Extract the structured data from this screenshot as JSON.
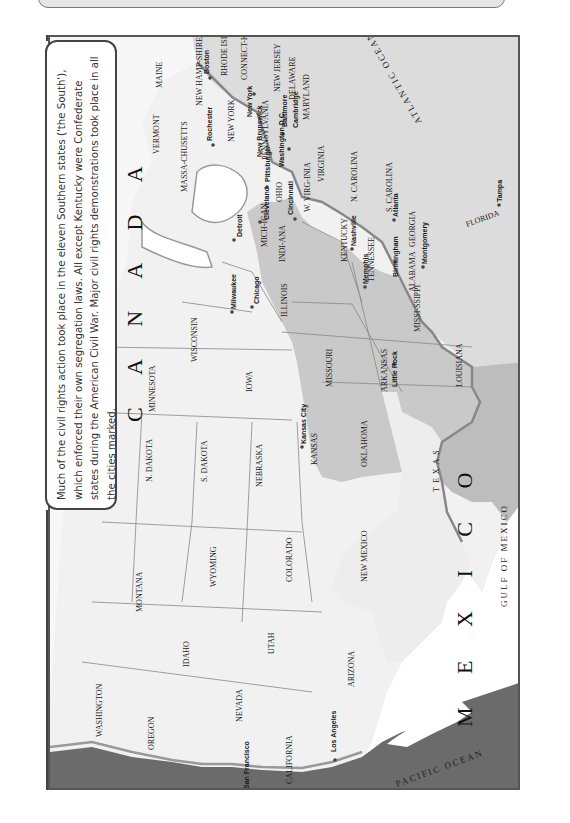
{
  "header": {
    "title_visible": ""
  },
  "info_box": {
    "text": "Much of the civil rights action took place in the eleven Southern states ('the South'), which enforced their own segregation laws. All except Kentucky were Confederate states during the American Civil War. Major civil rights demonstrations took place in all the cities marked."
  },
  "map": {
    "orientation": "rotated 90° clockwise (north points right)",
    "colors": {
      "land": "#efefef",
      "southern_states": "#c9c9c9",
      "ocean_light": "#d8d8d8",
      "ocean_dark": "#6b6b6b",
      "foreign_land": "#ffffff",
      "border": "#777777"
    },
    "regions": {
      "canada": "C A N A D A",
      "mexico": "M E X I C O",
      "atlantic": "ATLANTIC OCEAN",
      "pacific": "PACIFIC OCEAN",
      "gulf": "GULF OF MEXICO"
    },
    "states": [
      {
        "name": "MAINE",
        "south": false
      },
      {
        "name": "NEW HAMP-SHIRE",
        "south": false
      },
      {
        "name": "VERMONT",
        "south": false
      },
      {
        "name": "MASSA-CHUSETTS",
        "south": false
      },
      {
        "name": "RHODE ISLAND",
        "south": false
      },
      {
        "name": "CONNECT-ICUT",
        "south": false
      },
      {
        "name": "NEW YORK",
        "south": false
      },
      {
        "name": "NEW JERSEY",
        "south": false
      },
      {
        "name": "PENNSYLVANIA",
        "south": false
      },
      {
        "name": "DELAWARE",
        "south": false
      },
      {
        "name": "MARYLAND",
        "south": false
      },
      {
        "name": "D.C.",
        "south": false
      },
      {
        "name": "VIRGINIA",
        "south": true
      },
      {
        "name": "W. VIRG-INIA",
        "south": false
      },
      {
        "name": "N. CAROLINA",
        "south": true
      },
      {
        "name": "S. CAROLINA",
        "south": true
      },
      {
        "name": "GEORGIA",
        "south": true
      },
      {
        "name": "FLORIDA",
        "south": true
      },
      {
        "name": "ALABAMA",
        "south": true
      },
      {
        "name": "MISSI-SSIPPI",
        "south": true
      },
      {
        "name": "TENNESSEE",
        "south": true
      },
      {
        "name": "KENTUCKY",
        "south": true
      },
      {
        "name": "LOUISIANA",
        "south": true
      },
      {
        "name": "ARKANSAS",
        "south": true
      },
      {
        "name": "TEXAS",
        "south": true
      },
      {
        "name": "OHIO",
        "south": false
      },
      {
        "name": "MICH-IGAN",
        "south": false
      },
      {
        "name": "INDI-ANA",
        "south": false
      },
      {
        "name": "ILLINOIS",
        "south": false
      },
      {
        "name": "WISCONSIN",
        "south": false
      },
      {
        "name": "MINNESOTA",
        "south": false
      },
      {
        "name": "IOWA",
        "south": false
      },
      {
        "name": "MISSOURI",
        "south": false
      },
      {
        "name": "N. DAKOTA",
        "south": false
      },
      {
        "name": "S. DAKOTA",
        "south": false
      },
      {
        "name": "NEBRASKA",
        "south": false
      },
      {
        "name": "KANSAS",
        "south": false
      },
      {
        "name": "OKLAHOMA",
        "south": false
      },
      {
        "name": "MONTANA",
        "south": false
      },
      {
        "name": "WYOMING",
        "south": false
      },
      {
        "name": "COLORADO",
        "south": false
      },
      {
        "name": "NEW MEXICO",
        "south": false
      },
      {
        "name": "IDAHO",
        "south": false
      },
      {
        "name": "UTAH",
        "south": false
      },
      {
        "name": "ARIZONA",
        "south": false
      },
      {
        "name": "NEVADA",
        "south": false
      },
      {
        "name": "WASHINGTON",
        "south": false
      },
      {
        "name": "OREGON",
        "south": false
      },
      {
        "name": "CALIFORNIA",
        "south": false
      }
    ],
    "cities": [
      "Boston",
      "Rochester",
      "New York",
      "New Brunswick",
      "Baltimore",
      "Cambridge",
      "Washington D.C.",
      "Pittsburgh",
      "Cleveland",
      "Cincinnati",
      "Detroit",
      "Chicago",
      "Milwaukee",
      "Nashville",
      "Memphis",
      "Atlanta",
      "Birmingham",
      "Montgomery",
      "Tampa",
      "Little Rock",
      "Kansas City",
      "San Francisco",
      "Los Angeles"
    ]
  }
}
